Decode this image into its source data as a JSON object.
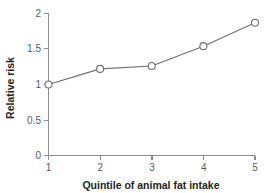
{
  "chart_data": {
    "type": "line",
    "title": "",
    "xlabel": "Quintile of animal fat intake",
    "ylabel": "Relative risk",
    "x": [
      1,
      2,
      3,
      4,
      5
    ],
    "values": [
      1.0,
      1.22,
      1.26,
      1.54,
      1.87
    ],
    "categories": [
      "1",
      "2",
      "3",
      "4",
      "5"
    ],
    "xtick_labels": [
      "1",
      "2",
      "3",
      "4",
      "5"
    ],
    "ytick_labels": [
      "0",
      "0.5",
      "1",
      "1.5",
      "2"
    ],
    "yticks": [
      0,
      0.5,
      1,
      1.5,
      2
    ],
    "xlim": [
      1,
      5
    ],
    "ylim": [
      0,
      2
    ],
    "grid": false,
    "legend": false,
    "legend_position": "none",
    "marker": "open-circle",
    "line_color": "#6e6e6e",
    "marker_face_color": "#ffffff",
    "axis_color": "#8c8c8c",
    "text_color": "#231f20",
    "tick_label_color": "#5b5b5b",
    "background_color": "#ffffff"
  },
  "axis": {
    "x_title": "Quintile of animal fat intake",
    "y_title": "Relative risk"
  },
  "yticks": {
    "t0": "0",
    "t1": "0.5",
    "t2": "1",
    "t3": "1.5",
    "t4": "2"
  },
  "xticks": {
    "t0": "1",
    "t1": "2",
    "t2": "3",
    "t3": "4",
    "t4": "5"
  }
}
